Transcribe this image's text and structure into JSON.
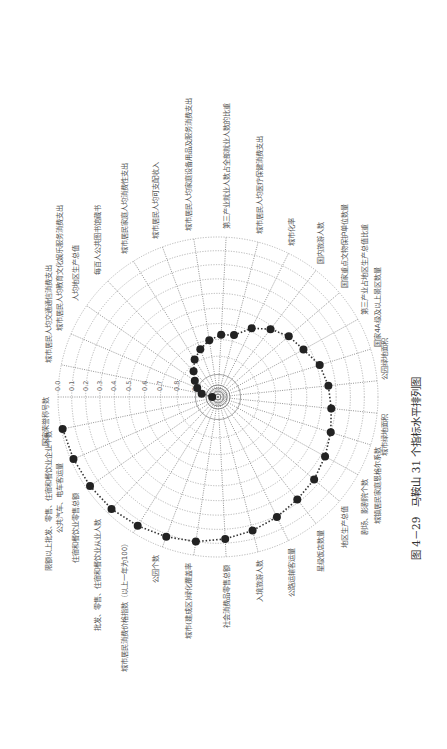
{
  "figure": {
    "caption": "图 4－29　马鞍山 31 个指标水平排列图",
    "rotation_deg": 90
  },
  "chart_data": {
    "type": "radar",
    "title": "马鞍山 31 个指标水平排列图",
    "figure_number": "图 4－29",
    "radial_axis": {
      "ticks": [
        "0.0",
        "0.1",
        "0.2",
        "0.3",
        "0.4",
        "0.5",
        "0.6",
        "0.7",
        "0.8",
        "0.9",
        "1.0"
      ],
      "range": [
        0.0,
        1.0
      ],
      "direction": "outer=0.0, center=1.0",
      "grid": true
    },
    "categories": [
      "国家荣誉称号数",
      "城市居民人均交通通信消费支出",
      "城市居民人均教育文化娱乐服务消费支出",
      "人均地区生产总值",
      "每百人公共图书馆藏书",
      "城市居民家庭人均消费性支出",
      "城市居民人均可支配收入",
      "城市居民人均家庭设备用品及服务消费支出",
      "第三产业就业人数占全部就业人数的比重",
      "城市居民人均医疗保健消费支出",
      "城市化率",
      "国内旅游人数",
      "国家重点文物保护单位数量",
      "第三产业占地区生产总值比重",
      "国家4A级及以上景区数量",
      "公园绿地面积",
      "城市绿地面积",
      "城镇居民家庭恩格尔系数",
      "剧场、影剧院个数",
      "地区生产总值",
      "星级饭店数量",
      "公路运输客运量",
      "入境旅游人数",
      "社会消费品零售总额",
      "城市(建成区)绿化覆盖率",
      "公园个数",
      "城市居民消费价格指数（以上一年为100）",
      "批发、零售、住宿和餐饮业从业人数",
      "住宿和餐饮业零售总额",
      "公共汽车、电车客运量",
      "限额以上批发、零售、住宿和餐饮业企业个数"
    ],
    "series": [
      {
        "name": "马鞍山",
        "values": [
          0.98,
          0.93,
          0.9,
          0.87,
          0.83,
          0.78,
          0.74,
          0.7,
          0.67,
          0.66,
          0.58,
          0.52,
          0.47,
          0.44,
          0.38,
          0.35,
          0.33,
          0.3,
          0.27,
          0.24,
          0.22,
          0.19,
          0.16,
          0.13,
          0.1,
          0.08,
          0.06,
          0.04,
          0.03,
          0.02,
          0.01
        ]
      }
    ],
    "legend": null,
    "grid": true
  }
}
